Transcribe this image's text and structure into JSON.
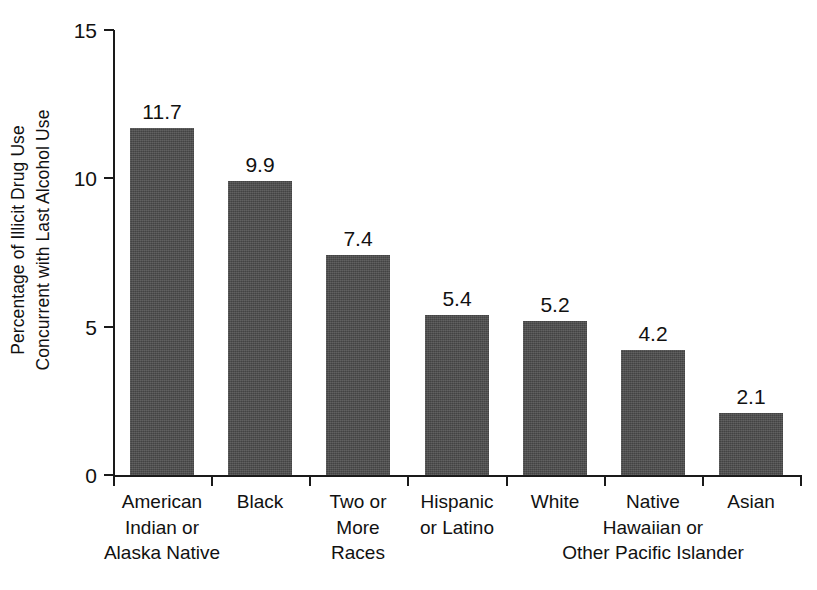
{
  "chart_data": {
    "type": "bar",
    "title": "",
    "subtitle": "",
    "xlabel": "",
    "ylabel": "Percentage of Illicit Drug Use Concurrent with Last Alcohol Use",
    "ylabel_lines": [
      "Percentage of Illicit Drug Use",
      "Concurrent with Last Alcohol Use"
    ],
    "categories": [
      "American Indian or Alaska Native",
      "Black",
      "Two or More Races",
      "Hispanic or Latino",
      "White",
      "Native Hawaiian or Other Pacific Islander",
      "Asian"
    ],
    "category_lines": [
      [
        "American",
        "Indian or",
        "Alaska Native"
      ],
      [
        "Black"
      ],
      [
        "Two or",
        "More",
        "Races"
      ],
      [
        "Hispanic",
        "or Latino"
      ],
      [
        "White"
      ],
      [
        "Native",
        "Hawaiian or",
        "Other Pacific Islander"
      ],
      [
        "Asian"
      ]
    ],
    "values": [
      11.7,
      9.9,
      7.4,
      5.4,
      5.2,
      4.2,
      2.1
    ],
    "value_labels": [
      "11.7",
      "9.9",
      "7.4",
      "5.4",
      "5.2",
      "4.2",
      "2.1"
    ],
    "ylim": [
      0,
      15
    ],
    "yticks": [
      0,
      5,
      10,
      15
    ],
    "ytick_labels": [
      "0",
      "5",
      "10",
      "15"
    ],
    "grid": false,
    "legend": null,
    "bar_color": "#4c4c4c",
    "axis_color": "#1a1a1a",
    "background_color": "#ffffff"
  }
}
